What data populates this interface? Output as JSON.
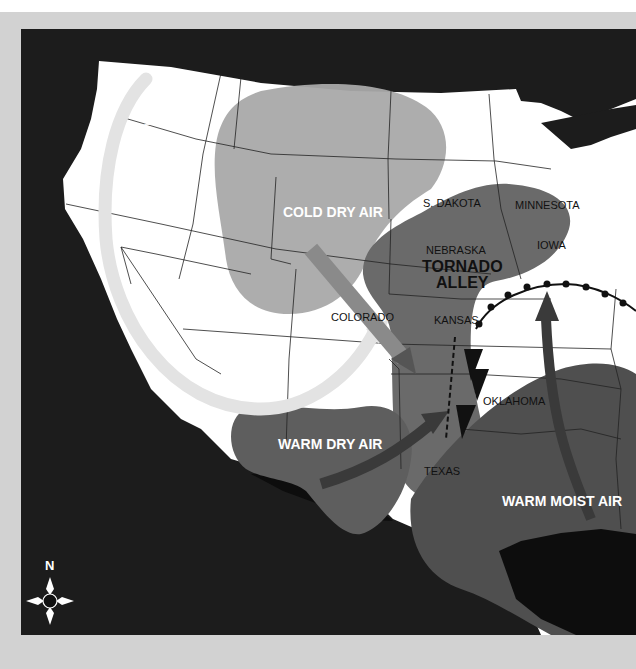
{
  "map": {
    "title": "Tornado Alley weather map",
    "colors": {
      "ocean": "#1c1c1c",
      "land": "#ffffff",
      "frame": "#d2d2d2",
      "cold_dry_air": "#a9a9a9",
      "tornado_alley": "#6a6a6a",
      "warm_dry_air": "#5e5e5e",
      "warm_moist_air": "#4f4f4f",
      "jet_stream": "#e3e3e3"
    },
    "air_masses": {
      "cold_dry": "COLD DRY AIR",
      "warm_dry": "WARM DRY AIR",
      "warm_moist": "WARM MOIST AIR"
    },
    "region": {
      "line1": "TORNADO",
      "line2": "ALLEY"
    },
    "jet_stream": "JET STREAM",
    "states": {
      "south_dakota": "S. DAKOTA",
      "minnesota": "MINNESOTA",
      "nebraska": "NEBRASKA",
      "iowa": "IOWA",
      "colorado": "COLORADO",
      "kansas": "KANSAS",
      "oklahoma": "OKLAHOMA",
      "texas": "TEXAS"
    },
    "compass": {
      "north_label": "N"
    }
  }
}
